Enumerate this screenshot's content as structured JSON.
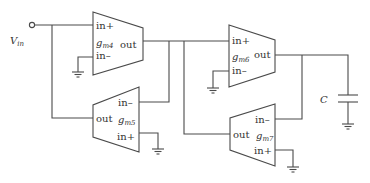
{
  "diagram": {
    "type": "circuit-schematic",
    "input": {
      "label": "V",
      "subscript": "in"
    },
    "capacitor": {
      "label": "C"
    },
    "blocks": [
      {
        "id": "gm4",
        "name": "g",
        "subscript": "m4",
        "pins": {
          "in_plus": "in+",
          "in_minus": "in–",
          "out": "out"
        }
      },
      {
        "id": "gm5",
        "name": "g",
        "subscript": "m5",
        "pins": {
          "in_plus": "in+",
          "in_minus": "in–",
          "out": "out"
        }
      },
      {
        "id": "gm6",
        "name": "g",
        "subscript": "m6",
        "pins": {
          "in_plus": "in+",
          "in_minus": "in–",
          "out": "out"
        }
      },
      {
        "id": "gm7",
        "name": "g",
        "subscript": "m7",
        "pins": {
          "in_plus": "in+",
          "in_minus": "in–",
          "out": "out"
        }
      }
    ],
    "connections": [
      "Vin -> gm4.in+",
      "gm5.out -> gm4.in+ (Vin node)",
      "gm4.in- -> ground",
      "gm4.out -> gm6.in+",
      "gm4.out -> gm5.in-",
      "gm7.out -> gm6.in+ (gm4.out node)",
      "gm5.in+ -> ground",
      "gm6.in- -> ground",
      "gm6.out -> C -> ground",
      "gm6.out -> gm7.in-",
      "gm7.in+ -> ground"
    ],
    "colors": {
      "line": "#4a4a4a",
      "text": "#333333",
      "background": "#ffffff"
    }
  }
}
